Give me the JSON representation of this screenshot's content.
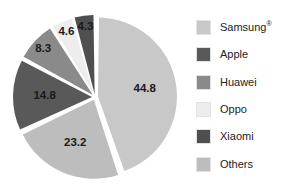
{
  "chart_data": {
    "type": "pie",
    "title": "",
    "xlabel": "",
    "ylabel": "",
    "legend_position": "right",
    "grid": false,
    "units": "percent",
    "exploded": true,
    "start_angle_deg": 0,
    "direction": "clockwise",
    "categories": [
      "Samsung®",
      "Others",
      "Apple",
      "Huawei",
      "Oppo",
      "Xiaomi"
    ],
    "values": [
      44.8,
      23.2,
      14.8,
      8.3,
      4.6,
      4.3
    ],
    "slices": [
      {
        "label": "Samsung®",
        "value": 44.8,
        "value_text": "44.8",
        "color": "#c8c8c8"
      },
      {
        "label": "Others",
        "value": 23.2,
        "value_text": "23.2",
        "color": "#bdbdbd"
      },
      {
        "label": "Apple",
        "value": 14.8,
        "value_text": "14.8",
        "color": "#595959"
      },
      {
        "label": "Huawei",
        "value": 8.3,
        "value_text": "8.3",
        "color": "#8a8a8a"
      },
      {
        "label": "Oppo",
        "value": 4.6,
        "value_text": "4.6",
        "color": "#ededed"
      },
      {
        "label": "Xiaomi",
        "value": 4.3,
        "value_text": "4.3",
        "color": "#4f4f4f"
      }
    ],
    "legend": [
      {
        "label": "Samsung",
        "suffix": "®",
        "color": "#c8c8c8"
      },
      {
        "label": "Apple",
        "suffix": "",
        "color": "#595959"
      },
      {
        "label": "Huawei",
        "suffix": "",
        "color": "#8a8a8a"
      },
      {
        "label": "Oppo",
        "suffix": "",
        "color": "#ededed"
      },
      {
        "label": "Xiaomi",
        "suffix": "",
        "color": "#4f4f4f"
      },
      {
        "label": "Others",
        "suffix": "",
        "color": "#bdbdbd"
      }
    ]
  },
  "colors": {
    "background": "#ffffff",
    "slice_gap": "#ffffff",
    "label_text": "#1a1a1a",
    "legend_text": "#222222"
  }
}
